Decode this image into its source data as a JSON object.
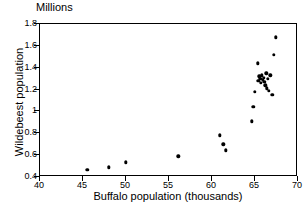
{
  "chart_data": {
    "type": "scatter",
    "title": "",
    "unit_caption": "Millions",
    "xlabel": "Buffalo population (thousands)",
    "ylabel": "Wildebeest population",
    "xlim": [
      40,
      70
    ],
    "ylim": [
      0.4,
      1.8
    ],
    "xticks": [
      40,
      45,
      50,
      55,
      60,
      65,
      70
    ],
    "xtick_labels": [
      "40",
      "45",
      "50",
      "55",
      "60",
      "65",
      "70"
    ],
    "yticks": [
      0.4,
      0.6,
      0.8,
      1.0,
      1.2,
      1.4,
      1.6,
      1.8
    ],
    "ytick_labels": [
      "0.4",
      "0.6",
      "0.8",
      "1",
      "1.2",
      "1.4",
      "1.6",
      "1.8"
    ],
    "grid": false,
    "legend": null,
    "marker": {
      "shape": "circle",
      "color": "#000000",
      "size_px": 3.4
    },
    "x": [
      45.5,
      48.0,
      50.0,
      56.1,
      60.9,
      61.3,
      61.6,
      64.6,
      64.8,
      65.0,
      65.3,
      65.4,
      65.5,
      65.6,
      65.7,
      65.8,
      65.9,
      66.0,
      66.1,
      66.2,
      66.3,
      66.4,
      66.5,
      66.6,
      66.8,
      67.0,
      67.2,
      67.4
    ],
    "y": [
      0.465,
      0.49,
      0.535,
      0.59,
      0.78,
      0.7,
      0.645,
      0.91,
      1.04,
      1.18,
      1.44,
      1.28,
      1.32,
      1.3,
      1.26,
      1.33,
      1.29,
      1.31,
      1.27,
      1.24,
      1.35,
      1.21,
      1.3,
      1.19,
      1.33,
      1.15,
      1.52,
      1.68
    ],
    "points": [
      {
        "x": 45.5,
        "y": 0.465
      },
      {
        "x": 48.0,
        "y": 0.49
      },
      {
        "x": 50.0,
        "y": 0.535
      },
      {
        "x": 56.1,
        "y": 0.59
      },
      {
        "x": 61.6,
        "y": 0.645
      },
      {
        "x": 61.3,
        "y": 0.7
      },
      {
        "x": 60.9,
        "y": 0.78
      },
      {
        "x": 64.6,
        "y": 0.91
      },
      {
        "x": 64.8,
        "y": 1.04
      },
      {
        "x": 65.0,
        "y": 1.18
      },
      {
        "x": 67.0,
        "y": 1.15
      },
      {
        "x": 66.6,
        "y": 1.19
      },
      {
        "x": 66.4,
        "y": 1.21
      },
      {
        "x": 66.2,
        "y": 1.24
      },
      {
        "x": 65.7,
        "y": 1.26
      },
      {
        "x": 66.1,
        "y": 1.27
      },
      {
        "x": 65.4,
        "y": 1.28
      },
      {
        "x": 65.9,
        "y": 1.29
      },
      {
        "x": 65.6,
        "y": 1.3
      },
      {
        "x": 66.5,
        "y": 1.3
      },
      {
        "x": 66.0,
        "y": 1.31
      },
      {
        "x": 65.5,
        "y": 1.32
      },
      {
        "x": 65.8,
        "y": 1.33
      },
      {
        "x": 66.8,
        "y": 1.33
      },
      {
        "x": 66.3,
        "y": 1.35
      },
      {
        "x": 65.3,
        "y": 1.44
      },
      {
        "x": 67.2,
        "y": 1.52
      },
      {
        "x": 67.4,
        "y": 1.68
      }
    ]
  }
}
